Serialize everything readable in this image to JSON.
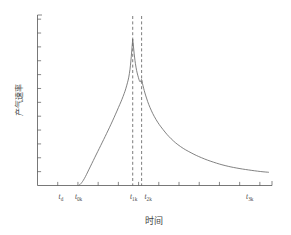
{
  "chart_data": {
    "type": "line",
    "title": "",
    "xlabel": "时间",
    "ylabel": "产气速率",
    "grid": false,
    "legend": null,
    "xlim": [
      0,
      10
    ],
    "ylim": [
      0,
      1.05
    ],
    "axis_style": "left-and-bottom-spines, unlabeled ticks",
    "x_tick_labels": [
      {
        "label_t": "t",
        "label_sub": "d",
        "x": 1.0
      },
      {
        "label_t": "t",
        "label_sub": "0k",
        "x": 1.75
      },
      {
        "label_t": "t",
        "label_sub": "1k",
        "x": 4.1
      },
      {
        "label_t": "t",
        "label_sub": "2k",
        "x": 4.72
      },
      {
        "label_t": "t",
        "label_sub": "3k",
        "x": 9.05
      }
    ],
    "x_tick_count": 11,
    "y_tick_count": 12,
    "markers": [
      {
        "name": "t1k-dashed-line",
        "x": 4.06,
        "style": "dashed"
      },
      {
        "name": "t2k-dashed-line",
        "x": 4.44,
        "style": "dashed"
      }
    ],
    "series": [
      {
        "name": "gas-production-rate",
        "description": "flat baseline until t0k, steep concave rise to a sharp main peak near t1k, small drop and secondary shoulder peak at t2k, then long exponential decay",
        "x": [
          1.75,
          1.85,
          2.0,
          2.2,
          2.45,
          2.7,
          2.95,
          3.2,
          3.45,
          3.65,
          3.8,
          3.92,
          4.0,
          4.06,
          4.12,
          4.2,
          4.3,
          4.38,
          4.44,
          4.5,
          4.62,
          4.8,
          5.05,
          5.35,
          5.7,
          6.1,
          6.55,
          7.0,
          7.5,
          8.0,
          8.5,
          9.0,
          9.5,
          9.85
        ],
        "y": [
          0.0,
          0.012,
          0.045,
          0.105,
          0.182,
          0.258,
          0.335,
          0.415,
          0.5,
          0.572,
          0.64,
          0.72,
          0.83,
          0.94,
          0.85,
          0.76,
          0.695,
          0.665,
          0.68,
          0.64,
          0.575,
          0.5,
          0.425,
          0.36,
          0.3,
          0.25,
          0.21,
          0.178,
          0.15,
          0.128,
          0.112,
          0.1,
          0.09,
          0.085
        ]
      }
    ]
  },
  "axes": {
    "x_title": "时间",
    "y_title": "产气速率"
  },
  "colors": {
    "curve": "#6b6b6b",
    "axis": "#555555",
    "dashed_marker": "#5a5a5a",
    "text": "#4a4a4a",
    "background": "#ffffff"
  }
}
